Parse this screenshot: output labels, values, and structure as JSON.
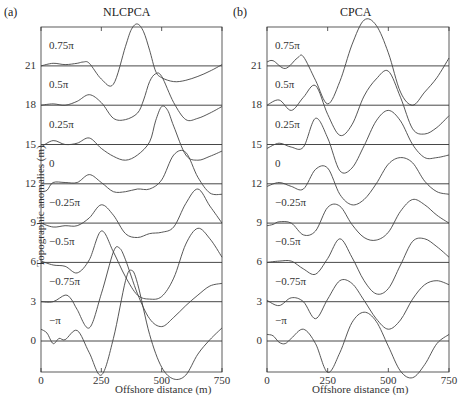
{
  "chart_data": [
    {
      "type": "line",
      "panel": "(a)",
      "title": "NLCPCA",
      "xlabel": "Offshore distance (m)",
      "ylabel": "Topographic anomalies (m)",
      "xlim": [
        0,
        750
      ],
      "xticks": [
        0,
        250,
        500,
        750
      ],
      "yticks": [
        0,
        3,
        6,
        9,
        12,
        15,
        18,
        21
      ],
      "grid": false,
      "series": [
        {
          "name": "0.75π",
          "offset": 21,
          "x": [
            0,
            50,
            100,
            150,
            175,
            200,
            250,
            300,
            350,
            375,
            400,
            425,
            450,
            475,
            500,
            550,
            600,
            650,
            700,
            750
          ],
          "y": [
            0,
            0.2,
            0.1,
            0.2,
            0.3,
            0.2,
            -1.0,
            -1.4,
            1.5,
            2.8,
            3.2,
            2.6,
            1.2,
            -0.4,
            -0.9,
            -1.2,
            -1.1,
            -0.8,
            -0.4,
            0.1
          ]
        },
        {
          "name": "0.5π",
          "offset": 18,
          "x": [
            0,
            50,
            100,
            150,
            200,
            250,
            300,
            350,
            400,
            425,
            450,
            475,
            500,
            550,
            600,
            650,
            700,
            750
          ],
          "y": [
            0,
            0.1,
            0,
            0.3,
            0.8,
            0.2,
            -1.0,
            -1.1,
            -0.6,
            0.4,
            1.8,
            2.4,
            2.2,
            0.2,
            -1.1,
            -1.0,
            -0.6,
            -0.1
          ]
        },
        {
          "name": "0.25π",
          "offset": 15,
          "x": [
            0,
            50,
            100,
            150,
            200,
            250,
            300,
            350,
            400,
            450,
            475,
            500,
            525,
            550,
            600,
            650,
            700,
            750
          ],
          "y": [
            -0.2,
            0.3,
            0.0,
            0.1,
            0.5,
            -0.3,
            -0.9,
            -1.2,
            -0.8,
            0.2,
            1.8,
            2.9,
            2.6,
            1.4,
            -0.8,
            -1.2,
            -0.9,
            -0.5
          ]
        },
        {
          "name": "0",
          "offset": 12,
          "x": [
            0,
            25,
            50,
            100,
            150,
            200,
            250,
            300,
            350,
            400,
            450,
            500,
            550,
            600,
            650,
            700,
            750
          ],
          "y": [
            -0.6,
            -0.5,
            0.1,
            0.1,
            0.1,
            0.7,
            0.1,
            -0.6,
            -0.6,
            -0.4,
            -0.4,
            0.3,
            2.2,
            2.4,
            0.5,
            -0.7,
            -0.8
          ]
        },
        {
          "name": "−0.25π",
          "offset": 9,
          "x": [
            0,
            50,
            100,
            150,
            200,
            250,
            300,
            350,
            400,
            450,
            500,
            550,
            600,
            650,
            700,
            750
          ],
          "y": [
            0,
            -0.3,
            -0.2,
            -0.2,
            0.4,
            1.4,
            0.6,
            -0.8,
            -1.1,
            -0.8,
            -0.7,
            -0.3,
            1.5,
            2.6,
            1.3,
            0
          ]
        },
        {
          "name": "−0.5π",
          "offset": 6,
          "x": [
            0,
            50,
            100,
            150,
            200,
            250,
            300,
            350,
            400,
            450,
            500,
            550,
            600,
            650,
            700,
            750
          ],
          "y": [
            0.1,
            -0.2,
            -0.3,
            -0.8,
            0.2,
            2.4,
            0.8,
            -1.1,
            -2.5,
            -2.8,
            -2.6,
            -1.2,
            1.4,
            2.6,
            1.8,
            0.4
          ]
        },
        {
          "name": "−0.75π",
          "offset": 3,
          "x": [
            0,
            50,
            100,
            125,
            150,
            200,
            250,
            300,
            325,
            350,
            400,
            450,
            500,
            550,
            600,
            650,
            700,
            750
          ],
          "y": [
            0,
            0,
            0.5,
            0.2,
            -0.6,
            -2.0,
            0.6,
            3.8,
            4.1,
            3.2,
            0.6,
            -1.3,
            -1.9,
            -1.2,
            -0.3,
            0.5,
            1.2,
            1.4
          ]
        },
        {
          "name": "−π",
          "offset": 0,
          "x": [
            0,
            25,
            50,
            75,
            100,
            150,
            200,
            250,
            300,
            350,
            375,
            400,
            450,
            500,
            550,
            600,
            650,
            700,
            750
          ],
          "y": [
            0.9,
            0.6,
            -0.2,
            0.2,
            0.1,
            0.8,
            -0.9,
            -2.6,
            0.2,
            4.6,
            5.4,
            4.4,
            0.5,
            -2.0,
            -2.9,
            -2.6,
            -1.0,
            0.1,
            1.0
          ]
        }
      ]
    },
    {
      "type": "line",
      "panel": "(b)",
      "title": "CPCA",
      "xlabel": "Offshore distance (m)",
      "ylabel": "Topographic anomalies (m)",
      "xlim": [
        0,
        750
      ],
      "xticks": [
        0,
        250,
        500,
        750
      ],
      "yticks": [
        0,
        3,
        6,
        9,
        12,
        15,
        18,
        21
      ],
      "grid": false,
      "series": [
        {
          "name": "0.75π",
          "offset": 21,
          "x": [
            0,
            25,
            75,
            125,
            150,
            200,
            250,
            300,
            350,
            400,
            450,
            500,
            550,
            600,
            650,
            700,
            750
          ],
          "y": [
            0.3,
            0.4,
            -0.2,
            0.6,
            0.7,
            -1.1,
            -2.9,
            -1.2,
            1.6,
            3.5,
            3.1,
            1.0,
            -2.0,
            -3.0,
            -2.0,
            -0.9,
            0.6
          ]
        },
        {
          "name": "0.5π",
          "offset": 18,
          "x": [
            0,
            50,
            100,
            150,
            200,
            250,
            300,
            350,
            400,
            450,
            500,
            550,
            600,
            650,
            700,
            750
          ],
          "y": [
            0,
            0.4,
            -0.4,
            0.6,
            1.5,
            -0.7,
            -2.3,
            -1.5,
            0.7,
            2.0,
            2.6,
            0.6,
            -1.8,
            -2.2,
            -1.7,
            -0.8
          ]
        },
        {
          "name": "0.25π",
          "offset": 15,
          "x": [
            0,
            50,
            100,
            150,
            200,
            250,
            300,
            350,
            400,
            450,
            500,
            550,
            600,
            650,
            700,
            750
          ],
          "y": [
            -0.3,
            0.1,
            -0.2,
            -0.2,
            2.0,
            0.5,
            -2.0,
            -1.8,
            -0.1,
            1.8,
            2.6,
            1.8,
            0,
            -1.0,
            -1.0,
            -0.8
          ]
        },
        {
          "name": "0",
          "offset": 12,
          "x": [
            0,
            50,
            100,
            150,
            200,
            250,
            300,
            350,
            400,
            450,
            500,
            550,
            600,
            650,
            700,
            750
          ],
          "y": [
            -0.2,
            0.1,
            -0.2,
            -0.4,
            1.1,
            1.2,
            -0.8,
            -1.6,
            -1.2,
            0,
            1.5,
            2.0,
            1.6,
            0.2,
            -0.6,
            -0.8
          ]
        },
        {
          "name": "−0.25π",
          "offset": 9,
          "x": [
            0,
            25,
            50,
            100,
            150,
            200,
            250,
            300,
            350,
            400,
            450,
            500,
            550,
            600,
            650,
            700,
            750
          ],
          "y": [
            -0.2,
            -0.1,
            0.1,
            0,
            -0.9,
            -0.6,
            1.2,
            1.3,
            -0.1,
            -1.1,
            -1.3,
            -0.7,
            0.9,
            1.8,
            1.4,
            0.6,
            0
          ]
        },
        {
          "name": "−0.5π",
          "offset": 6,
          "x": [
            0,
            50,
            100,
            150,
            200,
            250,
            300,
            350,
            400,
            450,
            500,
            550,
            600,
            650,
            700,
            750
          ],
          "y": [
            0,
            0.1,
            0.1,
            -0.5,
            -0.9,
            0.3,
            1.8,
            0.4,
            -1.4,
            -2.4,
            -2.0,
            -0.2,
            1.6,
            1.8,
            1.2,
            0.4
          ]
        },
        {
          "name": "−0.75π",
          "offset": 3,
          "x": [
            0,
            50,
            100,
            150,
            200,
            250,
            300,
            350,
            400,
            450,
            500,
            550,
            600,
            650,
            700,
            750
          ],
          "y": [
            0.1,
            -0.3,
            0.3,
            0,
            -1.3,
            0.2,
            1.6,
            1.4,
            0.1,
            -1.3,
            -2.1,
            -1.4,
            0.2,
            1.3,
            1.6,
            1.3
          ]
        },
        {
          "name": "−π",
          "offset": 0,
          "x": [
            0,
            25,
            50,
            75,
            100,
            150,
            200,
            250,
            300,
            350,
            400,
            450,
            500,
            550,
            600,
            650,
            700,
            750
          ],
          "y": [
            0.5,
            0.4,
            -0.1,
            -0.2,
            0.2,
            0.9,
            -0.2,
            -2.4,
            -0.9,
            1.4,
            2.2,
            1.5,
            -0.4,
            -2.3,
            -2.8,
            -1.8,
            -0.2,
            0.5
          ]
        }
      ]
    }
  ],
  "panels": [
    {
      "tag": "(a)",
      "title": "NLCPCA"
    },
    {
      "tag": "(b)",
      "title": "CPCA"
    }
  ],
  "axis": {
    "xlabel": "Offshore distance (m)",
    "ylabel": "Topographic anomalies (m)",
    "xticks": [
      "0",
      "250",
      "500",
      "750"
    ],
    "yticks": [
      "21",
      "18",
      "15",
      "12",
      "9",
      "6",
      "3",
      "0"
    ]
  },
  "phase_labels": [
    "0.75π",
    "0.5π",
    "0.25π",
    "0",
    "−0.25π",
    "−0.5π",
    "−0.75π",
    "−π"
  ],
  "colors": {
    "line": "#444444",
    "axis": "#333333"
  }
}
